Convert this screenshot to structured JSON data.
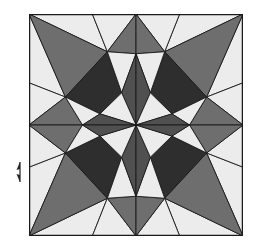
{
  "colors": {
    "light": "#ececec",
    "medium": "#6e6e6e",
    "dark": "#2e2e2e",
    "mid_dark": "#505050",
    "outline": "#1a1a1a",
    "background": "#ffffff"
  },
  "pattern": {
    "symmetry": "8-fold (square)",
    "fills": [
      "light",
      "medium",
      "dark",
      "mid_dark"
    ]
  },
  "side_marker": {
    "icon": "double-arrow-vertical-icon"
  }
}
